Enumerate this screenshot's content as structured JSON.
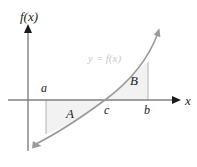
{
  "figure": {
    "name": "signed-area-under-curve-diagram",
    "background_color": "#ffffff"
  },
  "axes": {
    "y_axis_label": "f(x)",
    "x_axis_label": "x",
    "axis_color": "#808080",
    "origin_px": {
      "x": 28,
      "y": 100
    }
  },
  "curve": {
    "label": "y = f(x)",
    "label_color": "#c9c9c9",
    "stroke_color": "#9a9a9a",
    "description": "increasing curve rising from lower-left to upper-right, crossing the x-axis at c"
  },
  "points": [
    {
      "id": "a",
      "label": "a",
      "x_px": 46,
      "position": "above-axis"
    },
    {
      "id": "c",
      "label": "c",
      "x_px": 105,
      "position": "below-axis"
    },
    {
      "id": "b",
      "label": "b",
      "x_px": 148,
      "position": "below-axis"
    }
  ],
  "regions": [
    {
      "id": "A",
      "label": "A",
      "fill_color": "#f2f2f2",
      "bounded_between": "a and c",
      "side": "below-axis"
    },
    {
      "id": "B",
      "label": "B",
      "fill_color": "#f2f2f2",
      "bounded_between": "c and b",
      "side": "above-axis"
    }
  ]
}
